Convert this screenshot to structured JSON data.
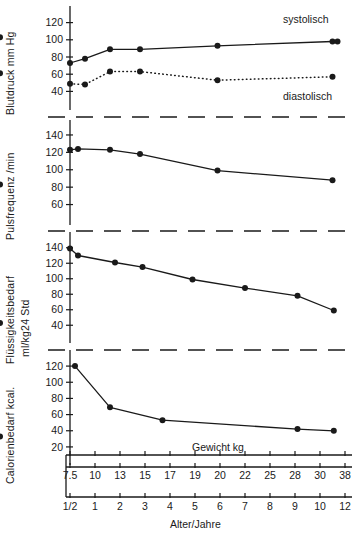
{
  "figure": {
    "title": "",
    "background": "#ffffff",
    "ink_color": "#1a1a1a",
    "panel_count": 4
  },
  "axis_labels": {
    "panel1_y": "Blutdruck mm Hg",
    "panel2_y": "Pulsfrequenz /min",
    "panel3_y_line1": "Flüssigkeitsbedarf",
    "panel3_y_line2": "ml/kg24 Std",
    "panel4_y": "Calorienbedarf  kcal.",
    "x_top": "Gewicht kg",
    "x_bottom": "Alter/Jahre"
  },
  "annotations": {
    "systolic": "systolisch",
    "diastolic": "diastolisch"
  },
  "axes": {
    "weight_ticks": [
      "7.5",
      "10",
      "13",
      "15",
      "17",
      "19",
      "20",
      "22",
      "25",
      "28",
      "30",
      "38"
    ],
    "age_ticks": [
      "1/2",
      "1",
      "2",
      "3",
      "4",
      "5",
      "6",
      "7",
      "8",
      "9",
      "10",
      "12"
    ],
    "panel1_yticks": [
      "120",
      "100",
      "80",
      "60",
      "40"
    ],
    "panel2_yticks": [
      "140",
      "120",
      "100",
      "80",
      "60"
    ],
    "panel3_yticks": [
      "140",
      "120",
      "100",
      "80",
      "60",
      "40"
    ],
    "panel4_yticks": [
      "120",
      "100",
      "80",
      "60",
      "40",
      "20"
    ]
  },
  "chart_data": [
    {
      "type": "line",
      "title": "Blutdruck mm Hg",
      "xlabel": "Alter/Jahre",
      "ylabel": "Blutdruck mm Hg",
      "ylim": [
        30,
        130
      ],
      "yticks": [
        40,
        60,
        80,
        100,
        120
      ],
      "grid": false,
      "legend": "inline-annotation",
      "series": [
        {
          "name": "systolisch",
          "style": "solid",
          "x_age": [
            0.5,
            0.8,
            1.6,
            2.8,
            5.9,
            11.0,
            11.4,
            12.2
          ],
          "values": [
            73,
            78,
            89,
            89,
            93,
            98,
            98,
            103
          ]
        },
        {
          "name": "diastolisch",
          "style": "dotted",
          "x_age": [
            0.5,
            0.8,
            1.6,
            2.8,
            5.9,
            11.0,
            12.2
          ],
          "values": [
            49,
            48,
            63,
            63,
            53,
            57,
            61
          ]
        }
      ]
    },
    {
      "type": "line",
      "title": "Pulsfrequenz /min",
      "xlabel": "Alter/Jahre",
      "ylabel": "Pulsfrequenz /min",
      "ylim": [
        48,
        148
      ],
      "yticks": [
        60,
        80,
        100,
        120,
        140
      ],
      "grid": false,
      "series": [
        {
          "name": "Pulsfrequenz",
          "style": "solid",
          "x_age": [
            0.5,
            0.66,
            1.6,
            2.8,
            5.9,
            11.0,
            12.2
          ],
          "values": [
            123,
            124,
            123,
            118,
            99,
            88,
            83
          ]
        }
      ]
    },
    {
      "type": "line",
      "title": "Flüssigkeitsbedarf ml/kg24 Std",
      "xlabel": "Alter/Jahre",
      "ylabel": "ml/kg24 Std",
      "ylim": [
        30,
        150
      ],
      "yticks": [
        40,
        60,
        80,
        100,
        120,
        140
      ],
      "grid": false,
      "series": [
        {
          "name": "Flüssigkeitsbedarf",
          "style": "solid",
          "x_age": [
            0.5,
            0.66,
            1.8,
            2.9,
            4.9,
            7.0,
            9.1,
            11.1,
            12.2
          ],
          "values": [
            139,
            130,
            121,
            115,
            99,
            88,
            78,
            59,
            43
          ]
        }
      ]
    },
    {
      "type": "line",
      "title": "Calorienbedarf kcal.",
      "xlabel": "Alter/Jahre",
      "ylabel": "Calorienbedarf  kcal.",
      "ylim": [
        10,
        130
      ],
      "yticks": [
        20,
        40,
        60,
        80,
        100,
        120
      ],
      "grid": false,
      "series": [
        {
          "name": "Calorienbedarf",
          "style": "solid",
          "x_age": [
            0.6,
            1.6,
            3.7,
            9.1,
            11.1,
            12.2
          ],
          "values": [
            120,
            69,
            53,
            42,
            40,
            33
          ]
        }
      ]
    }
  ]
}
